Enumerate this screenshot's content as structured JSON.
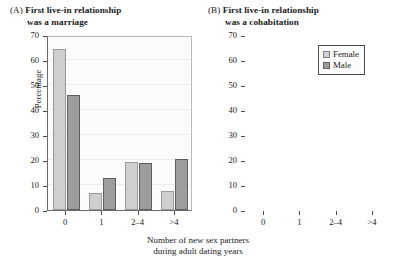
{
  "figure": {
    "xlabel_line1": "Number of new sex partners",
    "xlabel_line2": "during adult dating years",
    "ylabel": "Percentage"
  },
  "legend": {
    "female_label": "Female",
    "male_label": "Male",
    "female_color": "#cfcfcf",
    "male_color": "#9d9d9d"
  },
  "panels": [
    {
      "tag": "(A)",
      "title_line1": "First live-in relationship",
      "title_line2": "was a marriage"
    },
    {
      "tag": "(B)",
      "title_line1": "First live-in relationship",
      "title_line2": "was a cohabitation"
    }
  ],
  "chart_data": [
    {
      "type": "bar",
      "title": "(A) First live-in relationship was a marriage",
      "categories": [
        "0",
        "1",
        "2–4",
        ">4"
      ],
      "series": [
        {
          "name": "Female",
          "values": [
            64.5,
            6.8,
            19.2,
            7.8
          ]
        },
        {
          "name": "Male",
          "values": [
            46.0,
            13.0,
            19.0,
            20.5
          ]
        }
      ],
      "xlabel": "Number of new sex partners during adult dating years",
      "ylabel": "Percentage",
      "ylim": [
        0,
        70
      ],
      "yticks": [
        0,
        10,
        20,
        30,
        40,
        50,
        60,
        70
      ],
      "grid": true,
      "legend_position": "none"
    },
    {
      "type": "bar",
      "title": "(B) First live-in relationship was a cohabitation",
      "categories": [
        "0",
        "1",
        "2–4",
        ">4"
      ],
      "series": [
        {
          "name": "Female",
          "values": [
            32.5,
            23.0,
            25.0,
            19.7
          ]
        },
        {
          "name": "Male",
          "values": [
            20.5,
            11.3,
            32.0,
            36.5
          ]
        }
      ],
      "xlabel": "Number of new sex partners during adult dating years",
      "ylabel": "Percentage",
      "ylim": [
        0,
        70
      ],
      "yticks": [
        0,
        10,
        20,
        30,
        40,
        50,
        60,
        70
      ],
      "grid": true,
      "legend_position": "top-right"
    }
  ]
}
